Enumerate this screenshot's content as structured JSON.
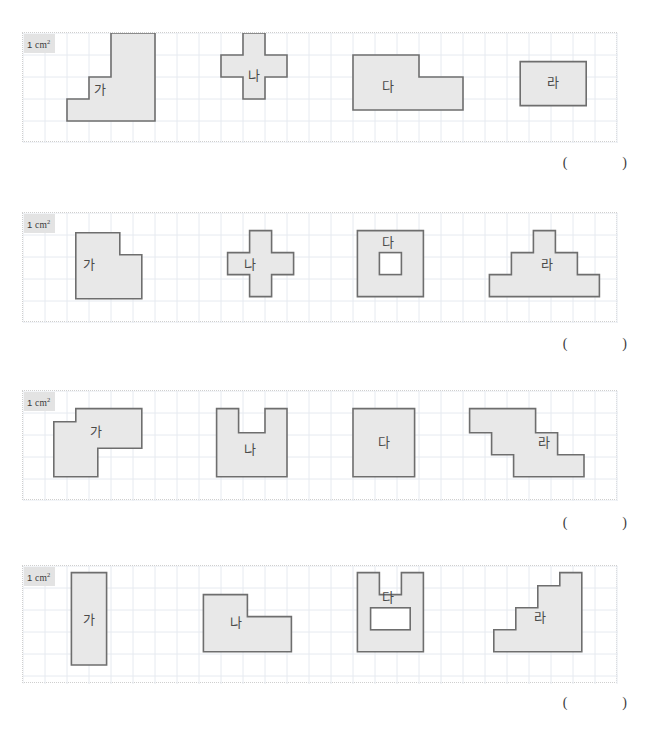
{
  "page": {
    "unit_label_number": "1",
    "unit_label_text": "cm",
    "unit_label_sup": "2",
    "paren_open": "(",
    "paren_close": ")",
    "grid_cell_px": 22,
    "panel_width_cells": 27,
    "colors": {
      "shape_fill": "#e8e8e8",
      "shape_stroke": "#6e6e6e",
      "grid_line": "#e6eaf0",
      "panel_border": "#cfcfcf",
      "label_badge_bg": "#e3e3e3",
      "text": "#4a4a4a",
      "page_bg": "#ffffff"
    }
  },
  "problems": [
    {
      "id": "problem-1",
      "top": 32,
      "panel_height": 110,
      "answer_top": 155,
      "rows": 5,
      "shapes": [
        {
          "name": "shape-ga",
          "label": "가",
          "label_cell": [
            3.5,
            2.6
          ],
          "points": [
            [
              2,
              4
            ],
            [
              2,
              3
            ],
            [
              3,
              3
            ],
            [
              3,
              2
            ],
            [
              4,
              2
            ],
            [
              4,
              0
            ],
            [
              6,
              0
            ],
            [
              6,
              4
            ]
          ],
          "holes": []
        },
        {
          "name": "shape-na",
          "label": "나",
          "label_cell": [
            10.5,
            2.0
          ],
          "points": [
            [
              9,
              1
            ],
            [
              10,
              1
            ],
            [
              10,
              0
            ],
            [
              11,
              0
            ],
            [
              11,
              1
            ],
            [
              12,
              1
            ],
            [
              12,
              2
            ],
            [
              11,
              2
            ],
            [
              11,
              3
            ],
            [
              10,
              3
            ],
            [
              10,
              2
            ],
            [
              9,
              2
            ]
          ],
          "holes": []
        },
        {
          "name": "shape-da",
          "label": "다",
          "label_cell": [
            16.6,
            2.5
          ],
          "points": [
            [
              15,
              1
            ],
            [
              18,
              1
            ],
            [
              18,
              2
            ],
            [
              20,
              2
            ],
            [
              20,
              3.5
            ],
            [
              15,
              3.5
            ]
          ],
          "holes": []
        },
        {
          "name": "shape-ra",
          "label": "라",
          "label_cell": [
            24.1,
            2.3
          ],
          "points": [
            [
              22.6,
              1.3
            ],
            [
              25.6,
              1.3
            ],
            [
              25.6,
              3.3
            ],
            [
              22.6,
              3.3
            ]
          ],
          "holes": []
        }
      ]
    },
    {
      "id": "problem-2",
      "top": 212,
      "panel_height": 110,
      "answer_top": 336,
      "rows": 5,
      "shapes": [
        {
          "name": "shape-ga",
          "label": "가",
          "label_cell": [
            3.0,
            2.4
          ],
          "points": [
            [
              2.4,
              0.9
            ],
            [
              4.4,
              0.9
            ],
            [
              4.4,
              1.9
            ],
            [
              5.4,
              1.9
            ],
            [
              5.4,
              3.9
            ],
            [
              2.4,
              3.9
            ]
          ],
          "holes": []
        },
        {
          "name": "shape-na",
          "label": "나",
          "label_cell": [
            10.3,
            2.4
          ],
          "points": [
            [
              9.3,
              1.8
            ],
            [
              10.3,
              1.8
            ],
            [
              10.3,
              0.8
            ],
            [
              11.3,
              0.8
            ],
            [
              11.3,
              1.8
            ],
            [
              12.3,
              1.8
            ],
            [
              12.3,
              2.8
            ],
            [
              11.3,
              2.8
            ],
            [
              11.3,
              3.8
            ],
            [
              10.3,
              3.8
            ],
            [
              10.3,
              2.8
            ],
            [
              9.3,
              2.8
            ]
          ],
          "holes": []
        },
        {
          "name": "shape-da",
          "label": "다",
          "label_cell": [
            16.6,
            1.4
          ],
          "points": [
            [
              15.2,
              0.8
            ],
            [
              18.2,
              0.8
            ],
            [
              18.2,
              3.8
            ],
            [
              15.2,
              3.8
            ]
          ],
          "holes": [
            [
              16.2,
              1.8,
              1,
              1
            ]
          ]
        },
        {
          "name": "shape-ra",
          "label": "라",
          "label_cell": [
            23.8,
            2.4
          ],
          "points": [
            [
              21.2,
              2.8
            ],
            [
              22.2,
              2.8
            ],
            [
              22.2,
              1.8
            ],
            [
              23.2,
              1.8
            ],
            [
              23.2,
              0.8
            ],
            [
              24.2,
              0.8
            ],
            [
              24.2,
              1.8
            ],
            [
              25.2,
              1.8
            ],
            [
              25.2,
              2.8
            ],
            [
              26.2,
              2.8
            ],
            [
              26.2,
              3.8
            ],
            [
              21.2,
              3.8
            ]
          ],
          "holes": []
        }
      ]
    },
    {
      "id": "problem-3",
      "top": 390,
      "panel_height": 110,
      "answer_top": 515,
      "rows": 5,
      "shapes": [
        {
          "name": "shape-ga",
          "label": "가",
          "label_cell": [
            3.3,
            1.9
          ],
          "points": [
            [
              1.4,
              1.4
            ],
            [
              2.4,
              1.4
            ],
            [
              2.4,
              0.8
            ],
            [
              5.4,
              0.8
            ],
            [
              5.4,
              2.6
            ],
            [
              3.4,
              2.6
            ],
            [
              3.4,
              3.9
            ],
            [
              1.4,
              3.9
            ]
          ],
          "holes": []
        },
        {
          "name": "shape-na",
          "label": "나",
          "label_cell": [
            10.3,
            2.7
          ],
          "points": [
            [
              8.8,
              0.8
            ],
            [
              9.8,
              0.8
            ],
            [
              9.8,
              1.9
            ],
            [
              11.0,
              1.9
            ],
            [
              11.0,
              0.8
            ],
            [
              12.0,
              0.8
            ],
            [
              12.0,
              3.9
            ],
            [
              8.8,
              3.9
            ]
          ],
          "holes": []
        },
        {
          "name": "shape-da",
          "label": "다",
          "label_cell": [
            16.4,
            2.4
          ],
          "points": [
            [
              15.0,
              0.8
            ],
            [
              17.8,
              0.8
            ],
            [
              17.8,
              3.9
            ],
            [
              15.0,
              3.9
            ]
          ],
          "holes": []
        },
        {
          "name": "shape-ra",
          "label": "라",
          "label_cell": [
            23.7,
            2.4
          ],
          "points": [
            [
              20.3,
              0.8
            ],
            [
              23.3,
              0.8
            ],
            [
              23.3,
              1.9
            ],
            [
              24.3,
              1.9
            ],
            [
              24.3,
              2.9
            ],
            [
              25.5,
              2.9
            ],
            [
              25.5,
              3.9
            ],
            [
              22.3,
              3.9
            ],
            [
              22.3,
              2.9
            ],
            [
              21.3,
              2.9
            ],
            [
              21.3,
              1.9
            ],
            [
              20.3,
              1.9
            ]
          ],
          "holes": []
        }
      ]
    },
    {
      "id": "problem-4",
      "top": 565,
      "panel_height": 118,
      "answer_top": 695,
      "rows": 5,
      "shapes": [
        {
          "name": "shape-ga",
          "label": "가",
          "label_cell": [
            3.0,
            2.5
          ],
          "points": [
            [
              2.2,
              0.3
            ],
            [
              3.8,
              0.3
            ],
            [
              3.8,
              4.5
            ],
            [
              2.2,
              4.5
            ]
          ],
          "holes": []
        },
        {
          "name": "shape-na",
          "label": "나",
          "label_cell": [
            9.7,
            2.6
          ],
          "points": [
            [
              8.2,
              1.3
            ],
            [
              10.2,
              1.3
            ],
            [
              10.2,
              2.3
            ],
            [
              12.2,
              2.3
            ],
            [
              12.2,
              3.9
            ],
            [
              8.2,
              3.9
            ]
          ],
          "holes": []
        },
        {
          "name": "shape-da",
          "label": "다",
          "label_cell": [
            16.6,
            1.5
          ],
          "points": [
            [
              15.2,
              0.3
            ],
            [
              16.2,
              0.3
            ],
            [
              16.2,
              1.3
            ],
            [
              17.2,
              1.3
            ],
            [
              17.2,
              0.3
            ],
            [
              18.2,
              0.3
            ],
            [
              18.2,
              3.9
            ],
            [
              15.2,
              3.9
            ]
          ],
          "holes": [
            [
              15.8,
              1.9,
              1.8,
              1.0
            ]
          ]
        },
        {
          "name": "shape-ra",
          "label": "라",
          "label_cell": [
            23.5,
            2.4
          ],
          "points": [
            [
              21.4,
              2.9
            ],
            [
              22.4,
              2.9
            ],
            [
              22.4,
              1.9
            ],
            [
              23.4,
              1.9
            ],
            [
              23.4,
              0.9
            ],
            [
              24.4,
              0.9
            ],
            [
              24.4,
              0.3
            ],
            [
              25.4,
              0.3
            ],
            [
              25.4,
              3.9
            ],
            [
              21.4,
              3.9
            ]
          ],
          "holes": []
        }
      ]
    }
  ]
}
